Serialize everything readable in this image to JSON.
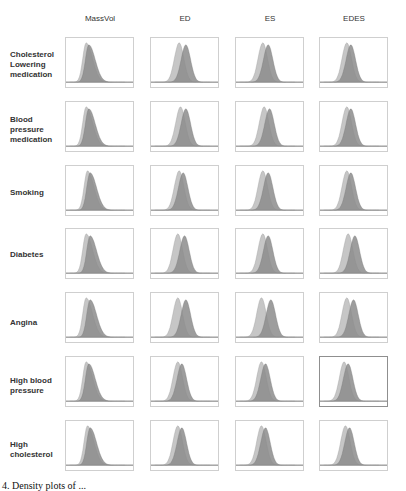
{
  "chart_data": {
    "type": "area",
    "title": "",
    "layout": "grid 7 rows x 4 columns of overlaid density plots (two overlapping distributions per panel)",
    "columns": [
      "MassVol",
      "ED",
      "ES",
      "EDES"
    ],
    "rows": [
      "Cholesterol Lowering medication",
      "Blood pressure medication",
      "Smoking",
      "Diabetes",
      "Angina",
      "High blood pressure",
      "High cholesterol"
    ],
    "series": [
      {
        "name": "group A (light grey)",
        "color": "#c6c6c6"
      },
      {
        "name": "group B (dark grey overlap)",
        "color": "#8c8c8c"
      }
    ],
    "axes": {
      "x_ticks": "none shown",
      "y_ticks": "none shown",
      "grid": false
    },
    "panels": [
      [
        {
          "peakA": 0.3,
          "peakB": 0.34,
          "skew": 1
        },
        {
          "peakA": 0.42,
          "peakB": 0.52,
          "skew": 0
        },
        {
          "peakA": 0.4,
          "peakB": 0.48,
          "skew": 0
        },
        {
          "peakA": 0.4,
          "peakB": 0.46,
          "skew": 0
        }
      ],
      [
        {
          "peakA": 0.3,
          "peakB": 0.34,
          "skew": 1
        },
        {
          "peakA": 0.44,
          "peakB": 0.52,
          "skew": 0
        },
        {
          "peakA": 0.42,
          "peakB": 0.5,
          "skew": 0
        },
        {
          "peakA": 0.4,
          "peakB": 0.46,
          "skew": 0
        }
      ],
      [
        {
          "peakA": 0.32,
          "peakB": 0.36,
          "skew": 1
        },
        {
          "peakA": 0.42,
          "peakB": 0.48,
          "skew": 0
        },
        {
          "peakA": 0.4,
          "peakB": 0.48,
          "skew": 0
        },
        {
          "peakA": 0.4,
          "peakB": 0.46,
          "skew": 0
        }
      ],
      [
        {
          "peakA": 0.3,
          "peakB": 0.36,
          "skew": 1
        },
        {
          "peakA": 0.4,
          "peakB": 0.5,
          "skew": 0
        },
        {
          "peakA": 0.4,
          "peakB": 0.48,
          "skew": 0
        },
        {
          "peakA": 0.42,
          "peakB": 0.52,
          "skew": 0
        }
      ],
      [
        {
          "peakA": 0.3,
          "peakB": 0.36,
          "skew": 1
        },
        {
          "peakA": 0.4,
          "peakB": 0.52,
          "skew": 0
        },
        {
          "peakA": 0.38,
          "peakB": 0.52,
          "skew": 0
        },
        {
          "peakA": 0.4,
          "peakB": 0.5,
          "skew": 0
        }
      ],
      [
        {
          "peakA": 0.3,
          "peakB": 0.34,
          "skew": 1
        },
        {
          "peakA": 0.4,
          "peakB": 0.46,
          "skew": 0
        },
        {
          "peakA": 0.38,
          "peakB": 0.44,
          "skew": 0
        },
        {
          "peakA": 0.36,
          "peakB": 0.42,
          "skew": 0
        }
      ],
      [
        {
          "peakA": 0.32,
          "peakB": 0.36,
          "skew": 1
        },
        {
          "peakA": 0.4,
          "peakB": 0.46,
          "skew": 0
        },
        {
          "peakA": 0.38,
          "peakB": 0.44,
          "skew": 0
        },
        {
          "peakA": 0.38,
          "peakB": 0.44,
          "skew": 0
        }
      ]
    ]
  },
  "headers": {
    "c0": "MassVol",
    "c1": "ED",
    "c2": "ES",
    "c3": "EDES"
  },
  "labels": {
    "r0": "Cholesterol Lowering medication",
    "r1": "Blood pressure medication",
    "r2": "Smoking",
    "r3": "Diabetes",
    "r4": "Angina",
    "r5": "High blood pressure",
    "r6": "High cholesterol"
  },
  "caption": "4.  Density plots of ..."
}
